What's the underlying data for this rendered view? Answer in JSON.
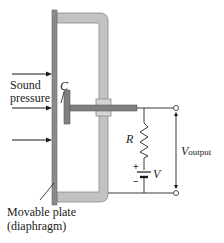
{
  "diagram": {
    "labels": {
      "sound_pressure_line1": "Sound",
      "sound_pressure_line2": "pressure",
      "capacitor": "C",
      "resistor": "R",
      "battery": "V",
      "battery_plus": "+",
      "battery_minus": "−",
      "output_main": "V",
      "output_sub": "output",
      "plate_line1": "Movable plate",
      "plate_line2": "(diaphragm)"
    },
    "colors": {
      "plate": "#8a8a8a",
      "bracket": "#bdbdbd",
      "bracket_edge": "#8c8c8c",
      "t_piece": "#7f7f7f",
      "wire": "#3a3a3a",
      "text": "#1a1a1a"
    },
    "arrows": {
      "count": 3,
      "direction": "right"
    }
  }
}
